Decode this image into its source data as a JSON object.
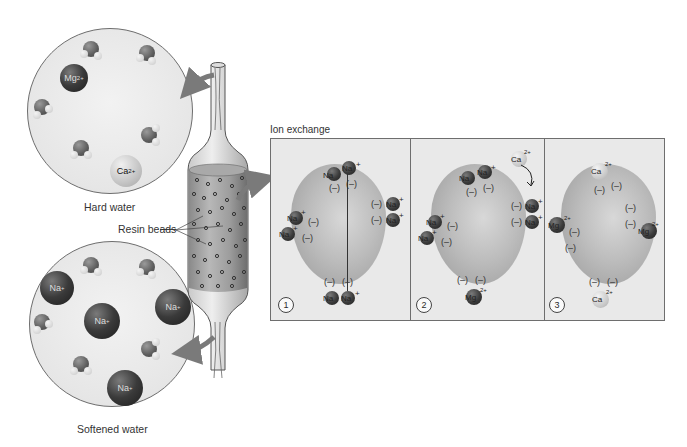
{
  "labels": {
    "hard_water": "Hard water",
    "softened_water": "Softened water",
    "resin_beads": "Resin beads",
    "ion_exchange": "Ion exchange"
  },
  "hard_water_ions": [
    {
      "symbol": "Mg",
      "charge": "2+",
      "shade": "dark"
    },
    {
      "symbol": "Ca",
      "charge": "2+",
      "shade": "light"
    }
  ],
  "softened_water_ions": [
    {
      "symbol": "Na",
      "charge": "+"
    },
    {
      "symbol": "Na",
      "charge": "+"
    },
    {
      "symbol": "Na",
      "charge": "+"
    },
    {
      "symbol": "Na",
      "charge": "+"
    }
  ],
  "panels": [
    {
      "number": "1",
      "ions": [
        {
          "text": "Na⁺"
        },
        {
          "text": "Na⁺"
        },
        {
          "text": "Na⁺"
        },
        {
          "text": "Na⁺"
        },
        {
          "text": "Na⁺"
        },
        {
          "text": "Na⁺"
        },
        {
          "text": "Na⁺"
        },
        {
          "text": "Na⁺"
        }
      ],
      "charge_sites": "(–)"
    },
    {
      "number": "2",
      "ions": [
        {
          "text": "Na⁺"
        },
        {
          "text": "Na⁺"
        },
        {
          "text": "Na⁺"
        },
        {
          "text": "Na⁺"
        },
        {
          "text": "Na⁺"
        },
        {
          "text": "Na⁺"
        },
        {
          "text": "Mg²⁺"
        },
        {
          "text": "Ca²⁺"
        }
      ],
      "charge_sites": "(–)"
    },
    {
      "number": "3",
      "ions": [
        {
          "text": "Ca²⁺"
        },
        {
          "text": "Mg²⁺"
        },
        {
          "text": "Mg²⁺"
        },
        {
          "text": "Ca²⁺"
        }
      ],
      "charge_sites": "(–)"
    }
  ],
  "symbols": {
    "neg": "(–)",
    "na": "Na",
    "mg": "Mg",
    "ca": "Ca",
    "plus": "+",
    "two_plus": "2+"
  }
}
